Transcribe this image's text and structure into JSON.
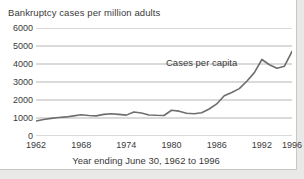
{
  "figure": {
    "background_color": "#ffffff",
    "page_background_color": "#e9e9e7",
    "border_color": "#c8c8c6"
  },
  "chart_data": {
    "type": "line",
    "title": "Bankruptcy cases per million adults",
    "xlabel": "Year ending June 30, 1962 to 1996",
    "ylabel": "",
    "annotation": "Cases per capita",
    "series_name": "Cases per capita",
    "line_color": "#6e6e6e",
    "grid": true,
    "grid_color": "#b5b5b5",
    "legend_position": "none",
    "xlim": [
      1962,
      1996
    ],
    "ylim": [
      0,
      6000
    ],
    "yticks": [
      0,
      1000,
      2000,
      3000,
      4000,
      5000,
      6000
    ],
    "ytick_labels": [
      "0",
      "1000",
      "2000",
      "3000",
      "4000",
      "5000",
      "6000"
    ],
    "xticks": [
      1962,
      1968,
      1974,
      1980,
      1986,
      1992,
      1996
    ],
    "xtick_labels": [
      "1962",
      "1968",
      "1974",
      "1980",
      "1986",
      "1992",
      "1996"
    ],
    "x": [
      1962,
      1963,
      1964,
      1965,
      1966,
      1967,
      1968,
      1969,
      1970,
      1971,
      1972,
      1973,
      1974,
      1975,
      1976,
      1977,
      1978,
      1979,
      1980,
      1981,
      1982,
      1983,
      1984,
      1985,
      1986,
      1987,
      1988,
      1989,
      1990,
      1991,
      1992,
      1993,
      1994,
      1995,
      1996
    ],
    "values": [
      830,
      920,
      980,
      1030,
      1060,
      1120,
      1180,
      1140,
      1120,
      1200,
      1240,
      1200,
      1160,
      1330,
      1280,
      1170,
      1150,
      1140,
      1430,
      1380,
      1260,
      1240,
      1290,
      1500,
      1780,
      2240,
      2420,
      2630,
      3040,
      3520,
      4250,
      3960,
      3760,
      3880,
      4700
    ]
  }
}
